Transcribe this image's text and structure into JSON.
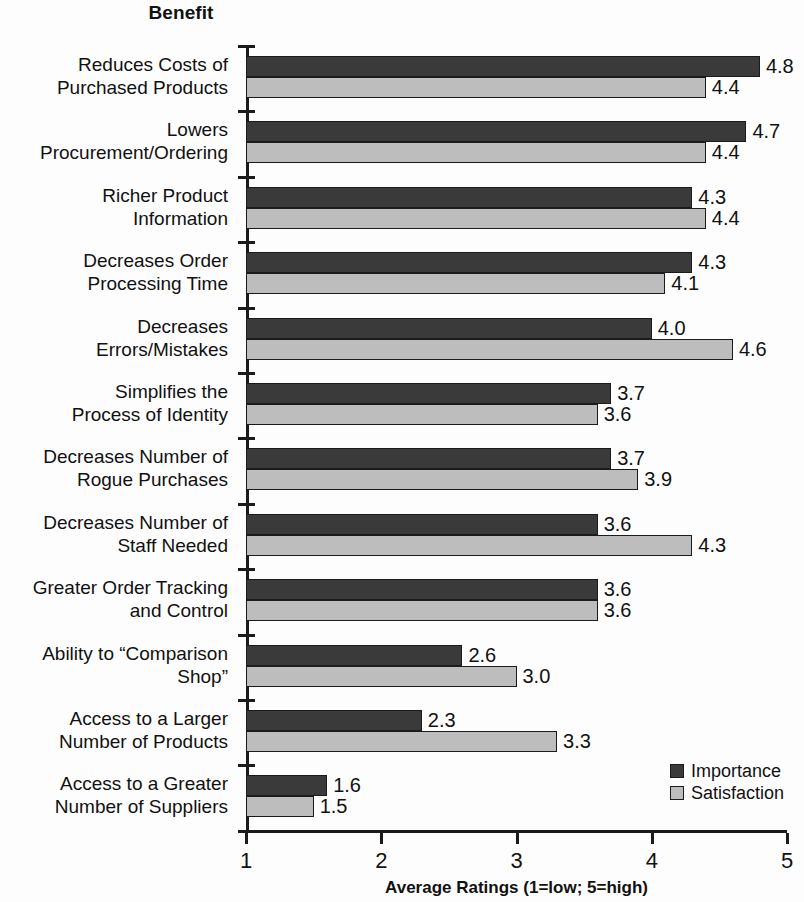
{
  "chart_data": {
    "type": "bar",
    "orientation": "horizontal",
    "title": "Benefit",
    "xlabel": "Average Ratings (1=low; 5=high)",
    "ylabel": "Benefit",
    "xlim": [
      1,
      5
    ],
    "xticks": [
      "1",
      "2",
      "3",
      "4",
      "5"
    ],
    "grid": false,
    "legend_position": "bottom-right",
    "categories": [
      "Reduces Costs of\nPurchased Products",
      "Lowers\nProcurement/Ordering",
      "Richer Product\nInformation",
      "Decreases Order\nProcessing Time",
      "Decreases\nErrors/Mistakes",
      "Simplifies the\nProcess of Identity",
      "Decreases Number of\nRogue Purchases",
      "Decreases Number of\nStaff Needed",
      "Greater Order Tracking\nand Control",
      "Ability to “Comparison\nShop”",
      "Access to a Larger\nNumber of Products",
      "Access to a Greater\nNumber of Suppliers"
    ],
    "series": [
      {
        "name": "Importance",
        "color": "#3a3a3a",
        "values": [
          4.8,
          4.7,
          4.3,
          4.3,
          4.0,
          3.7,
          3.7,
          3.6,
          3.6,
          2.6,
          2.3,
          1.6
        ],
        "labels": [
          "4.8",
          "4.7",
          "4.3",
          "4.3",
          "4.0",
          "3.7",
          "3.7",
          "3.6",
          "3.6",
          "2.6",
          "2.3",
          "1.6"
        ]
      },
      {
        "name": "Satisfaction",
        "color": "#bdbdbd",
        "values": [
          4.4,
          4.4,
          4.4,
          4.1,
          4.6,
          3.6,
          3.9,
          4.3,
          3.6,
          3.0,
          3.3,
          1.5
        ],
        "labels": [
          "4.4",
          "4.4",
          "4.4",
          "4.1",
          "4.6",
          "3.6",
          "3.9",
          "4.3",
          "3.6",
          "3.0",
          "3.3",
          "1.5"
        ]
      }
    ]
  },
  "legend": {
    "items": [
      {
        "label": "Importance",
        "swatch": "importance"
      },
      {
        "label": "Satisfaction",
        "swatch": "satisfaction"
      }
    ]
  }
}
